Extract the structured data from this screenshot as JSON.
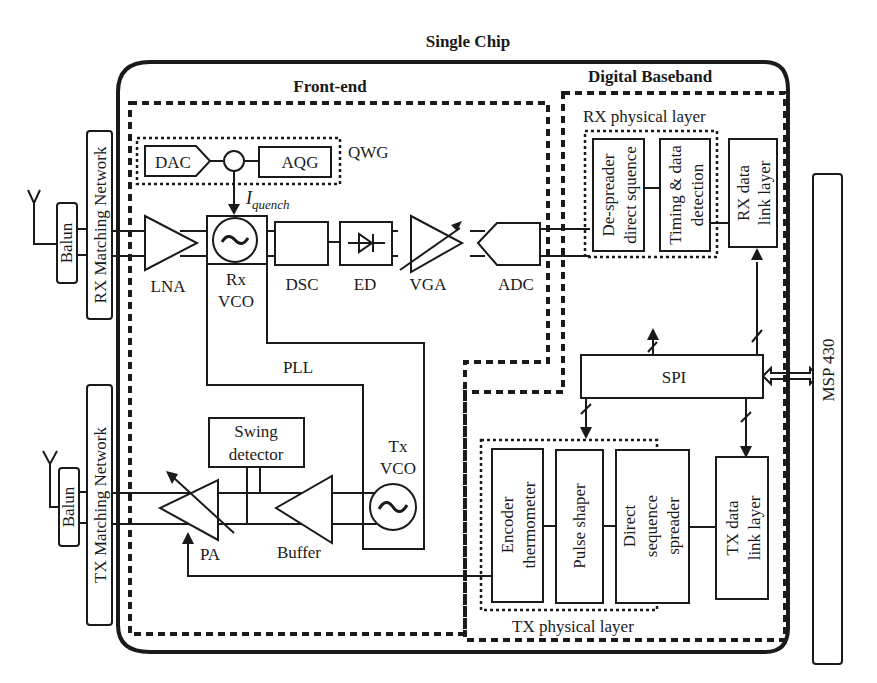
{
  "title": "Single Chip",
  "regions": {
    "front_end": "Front-end",
    "digital_baseband": "Digital Baseband",
    "rx_physical_layer": "RX physical layer",
    "tx_physical_layer": "TX physical layer",
    "qwg": "QWG",
    "pll": "PLL"
  },
  "external": {
    "rx_matching": "RX Matching Network",
    "tx_matching": "TX Matching Network",
    "balun_rx": "Balun",
    "balun_tx": "Balun",
    "msp": "MSP 430"
  },
  "rx_chain": {
    "dac": "DAC",
    "aqg": "AQG",
    "iquench_main": "I",
    "iquench_sub": "quench",
    "lna": "LNA",
    "rx_vco_1": "Rx",
    "rx_vco_2": "VCO",
    "dsc": "DSC",
    "ed": "ED",
    "vga": "VGA",
    "adc": "ADC"
  },
  "tx_chain": {
    "swing_1": "Swing",
    "swing_2": "detector",
    "tx_vco_1": "Tx",
    "tx_vco_2": "VCO",
    "pa": "PA",
    "buffer": "Buffer"
  },
  "baseband": {
    "despreader_1": "De-spreader",
    "despreader_2": "direct squence",
    "timing_1": "Timing & data",
    "timing_2": "detection",
    "rx_link_1": "RX data",
    "rx_link_2": "link layer",
    "spi": "SPI",
    "encoder_1": "Encoder",
    "encoder_2": "thermometer",
    "pulse": "Pulse shaper",
    "dss_1": "Direct",
    "dss_2": "sequence",
    "dss_3": "spreader",
    "tx_link_1": "TX data",
    "tx_link_2": "link layer"
  }
}
